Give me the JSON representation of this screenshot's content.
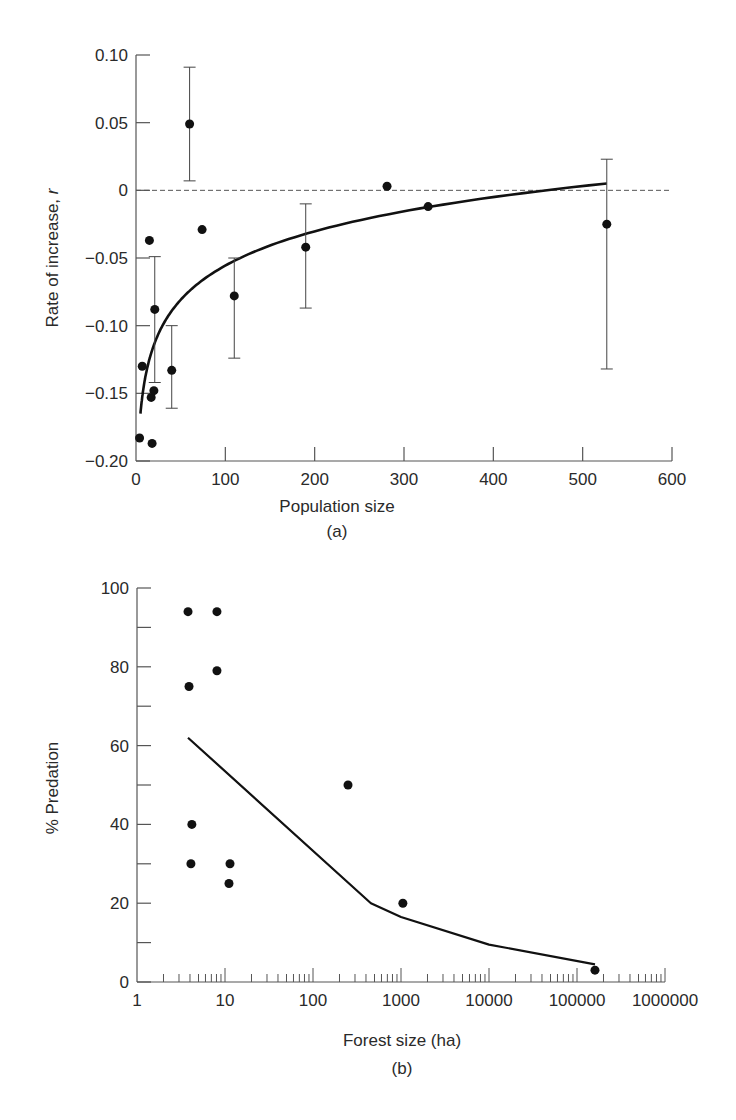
{
  "chart_data": [
    {
      "id": "a",
      "type": "scatter",
      "panel_label": "(a)",
      "title": "",
      "xlabel": "Population size",
      "ylabel": "Rate of increase, r",
      "xlim": [
        0,
        600
      ],
      "ylim": [
        -0.2,
        0.1
      ],
      "x_ticks": [
        0,
        100,
        200,
        300,
        400,
        500,
        600
      ],
      "x_tick_labels": [
        "0",
        "100",
        "200",
        "300",
        "400",
        "500",
        "600"
      ],
      "y_ticks": [
        -0.2,
        -0.15,
        -0.1,
        -0.05,
        0,
        0.05,
        0.1
      ],
      "y_tick_labels": [
        "−0.20",
        "−0.15",
        "−0.10",
        "−0.05",
        "0",
        "0.05",
        "0.10"
      ],
      "grid": false,
      "reference_line": {
        "y": 0,
        "style": "dashed"
      },
      "points": [
        {
          "x": 4,
          "y": -0.183
        },
        {
          "x": 7,
          "y": -0.13
        },
        {
          "x": 15,
          "y": -0.037
        },
        {
          "x": 17,
          "y": -0.153
        },
        {
          "x": 18,
          "y": -0.187
        },
        {
          "x": 20,
          "y": -0.148
        },
        {
          "x": 21,
          "y": -0.088,
          "err_hi": -0.049,
          "err_lo": -0.142
        },
        {
          "x": 40,
          "y": -0.133,
          "err_hi": -0.1,
          "err_lo": -0.161
        },
        {
          "x": 60,
          "y": 0.049,
          "err_hi": 0.091,
          "err_lo": 0.007
        },
        {
          "x": 74,
          "y": -0.029
        },
        {
          "x": 110,
          "y": -0.078,
          "err_hi": -0.05,
          "err_lo": -0.124
        },
        {
          "x": 190,
          "y": -0.042,
          "err_hi": -0.01,
          "err_lo": -0.087
        },
        {
          "x": 281,
          "y": 0.003
        },
        {
          "x": 327,
          "y": -0.012
        },
        {
          "x": 527,
          "y": -0.025,
          "err_hi": 0.023,
          "err_lo": -0.132
        }
      ],
      "fit_curve": {
        "form": "log",
        "a": -0.2237,
        "b": 0.0365,
        "x_start": 5,
        "x_end": 527
      }
    },
    {
      "id": "b",
      "type": "scatter",
      "panel_label": "(b)",
      "title": "",
      "xlabel": "Forest size (ha)",
      "ylabel": "% Predation",
      "xscale": "log",
      "xlim": [
        1,
        1000000
      ],
      "ylim": [
        0,
        100
      ],
      "x_ticks": [
        1,
        10,
        100,
        1000,
        10000,
        100000,
        1000000
      ],
      "x_tick_labels": [
        "1",
        "10",
        "100",
        "1000",
        "10000",
        "100000",
        "1000000"
      ],
      "y_ticks": [
        0,
        20,
        40,
        60,
        80,
        100
      ],
      "y_tick_labels": [
        "0",
        "20",
        "40",
        "60",
        "80",
        "100"
      ],
      "y_minor_ticks": [
        10,
        30,
        50,
        70,
        90
      ],
      "grid": false,
      "points": [
        {
          "x": 3.8,
          "y": 94
        },
        {
          "x": 8.1,
          "y": 94
        },
        {
          "x": 3.9,
          "y": 75
        },
        {
          "x": 8.1,
          "y": 79
        },
        {
          "x": 4.2,
          "y": 40
        },
        {
          "x": 4.1,
          "y": 30
        },
        {
          "x": 11.4,
          "y": 30
        },
        {
          "x": 11.1,
          "y": 25
        },
        {
          "x": 250,
          "y": 50
        },
        {
          "x": 1050,
          "y": 20
        },
        {
          "x": 160000,
          "y": 3
        }
      ],
      "fit_line": [
        {
          "x": 3.8,
          "y": 62
        },
        {
          "x": 455,
          "y": 20
        },
        {
          "x": 1000,
          "y": 16.5
        },
        {
          "x": 10000,
          "y": 9.5
        },
        {
          "x": 160000,
          "y": 4.5
        }
      ]
    }
  ]
}
